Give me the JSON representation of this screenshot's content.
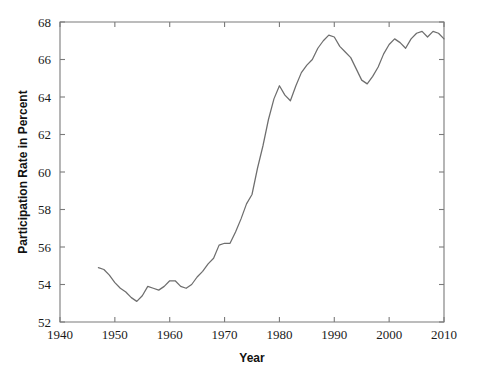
{
  "chart_data": {
    "type": "line",
    "title": "",
    "xlabel": "Year",
    "ylabel": "Participation Rate in Percent",
    "xlim": [
      1940,
      2010
    ],
    "ylim": [
      52,
      68
    ],
    "xticks": [
      1940,
      1950,
      1960,
      1970,
      1980,
      1990,
      2000,
      2010
    ],
    "xtick_labels": [
      "1940",
      "1950",
      "1960",
      "1970",
      "1980",
      "1990",
      "2000",
      "2010"
    ],
    "yticks": [
      52,
      54,
      56,
      58,
      60,
      62,
      64,
      66,
      68
    ],
    "ytick_labels": [
      "52",
      "54",
      "56",
      "58",
      "60",
      "62",
      "64",
      "66",
      "68"
    ],
    "grid": false,
    "legend": false,
    "legend_position": "none",
    "line_color": "#6e6e6e",
    "frame_color": "#7a7a7a",
    "series": [
      {
        "name": "Participation Rate",
        "x": [
          1947,
          1948,
          1949,
          1950,
          1951,
          1952,
          1953,
          1954,
          1955,
          1956,
          1957,
          1958,
          1959,
          1960,
          1961,
          1962,
          1963,
          1964,
          1965,
          1966,
          1967,
          1968,
          1969,
          1970,
          1971,
          1972,
          1973,
          1974,
          1975,
          1976,
          1977,
          1978,
          1979,
          1980,
          1981,
          1982,
          1983,
          1984,
          1985,
          1986,
          1987,
          1988,
          1989,
          1990,
          1991,
          1992,
          1993,
          1994,
          1995,
          1996,
          1997,
          1998,
          1999,
          2000,
          2001,
          2002,
          2003,
          2004,
          2005,
          2006,
          2007,
          2008,
          2009,
          2010
        ],
        "values": [
          54.9,
          54.8,
          54.5,
          54.1,
          53.8,
          53.6,
          53.3,
          53.1,
          53.4,
          53.9,
          53.8,
          53.7,
          53.9,
          54.2,
          54.2,
          53.9,
          53.8,
          54.0,
          54.4,
          54.7,
          55.1,
          55.4,
          56.1,
          56.2,
          56.2,
          56.8,
          57.5,
          58.3,
          58.8,
          60.2,
          61.4,
          62.8,
          63.9,
          64.6,
          64.1,
          63.8,
          64.6,
          65.3,
          65.7,
          66.0,
          66.6,
          67.0,
          67.3,
          67.2,
          66.7,
          66.4,
          66.1,
          65.5,
          64.9,
          64.7,
          65.1,
          65.6,
          66.3,
          66.8,
          67.1,
          66.9,
          66.6,
          67.1,
          67.4,
          67.5,
          67.2,
          67.5,
          67.4,
          67.1
        ]
      }
    ]
  },
  "axes": {
    "y_title": "Participation Rate in Percent",
    "x_title": "Year"
  }
}
